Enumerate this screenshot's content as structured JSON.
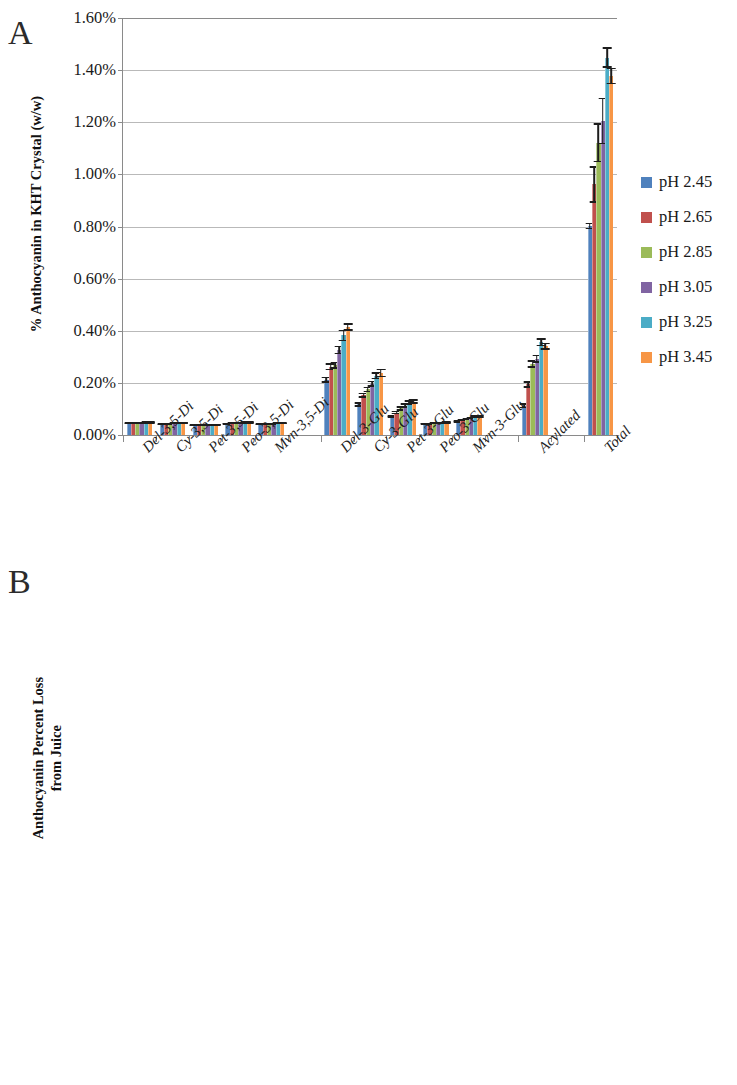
{
  "figure": {
    "panel_a_letter": "A",
    "panel_b_letter": "B"
  },
  "legend": {
    "items": [
      {
        "label": "pH 2.45",
        "color": "#4F81BD"
      },
      {
        "label": "pH 2.65",
        "color": "#C0504D"
      },
      {
        "label": "pH 2.85",
        "color": "#9BBB59"
      },
      {
        "label": "pH 3.05",
        "color": "#8064A2"
      },
      {
        "label": "pH 3.25",
        "color": "#4BACC6"
      },
      {
        "label": "pH 3.45",
        "color": "#F79646"
      }
    ]
  },
  "chart_data": [
    {
      "id": "panel-a",
      "type": "bar",
      "title": "",
      "panel_label": "A",
      "xlabel": "",
      "ylabel": "% Anthocyanin in KHT Crystal (w/w)",
      "ylim": [
        0,
        1.6
      ],
      "ytick_step": 0.2,
      "ytick_labels": [
        "0.00%",
        "0.20%",
        "0.40%",
        "0.60%",
        "0.80%",
        "1.00%",
        "1.20%",
        "1.40%",
        "1.60%"
      ],
      "ytick_values": [
        0,
        0.2,
        0.4,
        0.6,
        0.8,
        1.0,
        1.2,
        1.4,
        1.6
      ],
      "grid": true,
      "legend_position": "right",
      "categories": [
        "Del-3,5-Di",
        "Cy-3,5-Di",
        "Pet-3,5-Di",
        "Peo-3,5-Di",
        "Mvn-3,5-Di",
        "",
        "Del-3-Glu",
        "Cy-3-Glu",
        "Pet-3-Glu",
        "Peo-3-Glu",
        "Mvn-3-Glu",
        "",
        "Acylated",
        "",
        "Total"
      ],
      "series": [
        {
          "name": "pH 2.45",
          "color": "#4F81BD",
          "values": [
            0.045,
            0.042,
            0.037,
            0.044,
            0.041,
            null,
            0.212,
            0.118,
            0.071,
            0.043,
            0.052,
            null,
            0.112,
            null,
            0.802
          ],
          "errors": [
            0.004,
            0.004,
            0.004,
            0.004,
            0.004,
            null,
            0.012,
            0.009,
            0.006,
            0.004,
            0.005,
            null,
            0.01,
            null,
            0.012
          ]
        },
        {
          "name": "pH 2.65",
          "color": "#C0504D",
          "values": [
            0.046,
            0.043,
            0.038,
            0.045,
            0.042,
            null,
            0.262,
            0.152,
            0.086,
            0.044,
            0.058,
            null,
            0.194,
            null,
            0.962
          ],
          "errors": [
            0.004,
            0.004,
            0.004,
            0.004,
            0.004,
            null,
            0.014,
            0.01,
            0.007,
            0.004,
            0.005,
            null,
            0.012,
            null,
            0.07
          ]
        },
        {
          "name": "pH 2.85",
          "color": "#9BBB59",
          "values": [
            0.047,
            0.044,
            0.038,
            0.046,
            0.043,
            null,
            0.268,
            0.175,
            0.102,
            0.045,
            0.062,
            null,
            0.272,
            null,
            1.122
          ],
          "errors": [
            0.004,
            0.004,
            0.004,
            0.004,
            0.004,
            null,
            0.014,
            0.011,
            0.008,
            0.004,
            0.005,
            null,
            0.015,
            null,
            0.075
          ]
        },
        {
          "name": "pH 3.05",
          "color": "#8064A2",
          "values": [
            0.047,
            0.045,
            0.039,
            0.047,
            0.044,
            null,
            0.326,
            0.196,
            0.113,
            0.046,
            0.066,
            null,
            0.292,
            null,
            1.205
          ],
          "errors": [
            0.004,
            0.004,
            0.004,
            0.004,
            0.004,
            null,
            0.016,
            0.012,
            0.008,
            0.004,
            0.005,
            null,
            0.016,
            null,
            0.09
          ]
        },
        {
          "name": "pH 3.25",
          "color": "#4BACC6",
          "values": [
            0.048,
            0.046,
            0.04,
            0.048,
            0.045,
            null,
            0.382,
            0.228,
            0.124,
            0.047,
            0.07,
            null,
            0.356,
            null,
            1.448
          ],
          "errors": [
            0.004,
            0.004,
            0.004,
            0.004,
            0.004,
            null,
            0.022,
            0.014,
            0.009,
            0.004,
            0.006,
            null,
            0.015,
            null,
            0.04
          ]
        },
        {
          "name": "pH 3.45",
          "color": "#F79646",
          "values": [
            0.048,
            0.046,
            0.04,
            0.048,
            0.045,
            null,
            0.414,
            0.238,
            0.128,
            0.048,
            0.072,
            null,
            0.34,
            null,
            1.378
          ],
          "errors": [
            0.004,
            0.004,
            0.004,
            0.004,
            0.004,
            null,
            0.014,
            0.016,
            0.009,
            0.004,
            0.006,
            null,
            0.014,
            null,
            0.032
          ]
        }
      ]
    },
    {
      "id": "panel-b",
      "type": "bar",
      "title": "",
      "panel_label": "B",
      "xlabel": "",
      "ylabel": "Anthocyanin Percent Loss\nfrom Juice",
      "ylim": [
        0,
        40
      ],
      "ytick_step": 5,
      "ytick_labels": [
        "0%",
        "5%",
        "10%",
        "15%",
        "20%",
        "25%",
        "30%",
        "35%",
        "40%"
      ],
      "ytick_values": [
        0,
        5,
        10,
        15,
        20,
        25,
        30,
        35,
        40
      ],
      "grid": true,
      "legend_position": "right",
      "categories": [
        "Del-3,5-Di",
        "Cy-3,5-Di",
        "Pet-3,5-Di",
        "Peo-3,5-Di",
        "Mvn-3,5-Di",
        "",
        "Del-3-Glu",
        "Cy-3-Glu",
        "Pet-3-Glu",
        "Peo-3-Glu",
        "Mvn-3-Glu",
        "",
        "Acylated",
        "",
        "Total"
      ],
      "series": [
        {
          "name": "pH 2.45",
          "color": "#4F81BD",
          "values": [
            8.9,
            6.5,
            13.1,
            5.9,
            7.1,
            null,
            10.1,
            7.5,
            12.1,
            14.1,
            13.5,
            null,
            3.8,
            null,
            7.9
          ],
          "errors": [
            0.9,
            0.5,
            0.7,
            0.5,
            0.4,
            null,
            0.6,
            0.4,
            0.4,
            0.4,
            0.4,
            null,
            0.6,
            null,
            0.4
          ]
        },
        {
          "name": "pH 2.65",
          "color": "#C0504D",
          "values": [
            11.0,
            7.6,
            16.0,
            6.6,
            8.4,
            null,
            16.0,
            11.8,
            17.0,
            18.8,
            17.5,
            null,
            9.0,
            null,
            12.0
          ],
          "errors": [
            1.1,
            0.9,
            1.0,
            0.8,
            0.8,
            null,
            1.5,
            1.5,
            1.0,
            1.2,
            1.2,
            null,
            1.3,
            null,
            1.5
          ]
        },
        {
          "name": "pH 2.85",
          "color": "#9BBB59",
          "values": [
            11.9,
            8.5,
            17.2,
            7.2,
            8.9,
            null,
            22.2,
            16.2,
            22.8,
            20.3,
            22.3,
            null,
            16.8,
            null,
            16.5
          ],
          "errors": [
            1.0,
            0.8,
            0.9,
            0.7,
            0.7,
            null,
            2.2,
            1.8,
            2.0,
            1.8,
            2.0,
            null,
            1.8,
            null,
            1.5
          ]
        },
        {
          "name": "pH 3.05",
          "color": "#8064A2",
          "values": [
            12.6,
            9.0,
            17.6,
            7.6,
            9.3,
            null,
            27.8,
            20.2,
            26.1,
            24.3,
            25.1,
            null,
            19.0,
            null,
            19.4
          ],
          "errors": [
            1.2,
            0.9,
            1.0,
            0.8,
            0.8,
            null,
            2.4,
            2.1,
            2.3,
            2.0,
            2.1,
            null,
            1.5,
            null,
            2.0
          ]
        },
        {
          "name": "pH 3.25",
          "color": "#4BACC6",
          "values": [
            14.4,
            9.7,
            17.9,
            7.9,
            9.5,
            null,
            36.5,
            27.9,
            36.0,
            30.2,
            29.8,
            null,
            25.4,
            null,
            25.0
          ],
          "errors": [
            0.8,
            0.6,
            0.9,
            0.6,
            0.5,
            null,
            1.3,
            1.3,
            0.7,
            1.2,
            1.8,
            null,
            1.3,
            null,
            0.6
          ]
        },
        {
          "name": "pH 3.45",
          "color": "#F79646",
          "values": [
            12.8,
            8.8,
            16.7,
            6.9,
            8.2,
            null,
            34.0,
            25.3,
            32.7,
            25.4,
            26.9,
            null,
            20.5,
            null,
            21.8
          ],
          "errors": [
            0.8,
            0.5,
            0.9,
            0.6,
            0.6,
            null,
            2.2,
            2.5,
            1.8,
            3.0,
            1.5,
            null,
            2.0,
            null,
            1.8
          ]
        }
      ]
    }
  ]
}
